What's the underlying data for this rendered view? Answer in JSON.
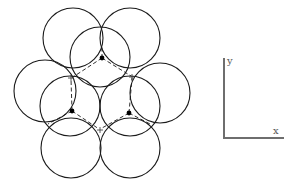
{
  "diagram": {
    "colors": {
      "stroke": "#1a1a1a",
      "axis": "#6e6e6e",
      "label": "#555555"
    },
    "back_layer_circles": [
      {
        "cx": 73,
        "cy": 38,
        "r": 30
      },
      {
        "cx": 130,
        "cy": 38,
        "r": 30
      },
      {
        "cx": 45,
        "cy": 91,
        "r": 31
      },
      {
        "cx": 160,
        "cy": 93,
        "r": 30
      },
      {
        "cx": 71,
        "cy": 148,
        "r": 30
      },
      {
        "cx": 130,
        "cy": 148,
        "r": 30
      }
    ],
    "front_layer_circles": [
      {
        "cx": 100,
        "cy": 57,
        "r": 30
      },
      {
        "cx": 70,
        "cy": 106,
        "r": 30
      },
      {
        "cx": 130,
        "cy": 106,
        "r": 30
      }
    ],
    "atom_dots": [
      {
        "x": 102,
        "y": 58
      },
      {
        "x": 72,
        "y": 111
      },
      {
        "x": 129,
        "y": 113
      }
    ],
    "plus_markers": [
      {
        "x": 71,
        "y": 78,
        "symbol": "+"
      },
      {
        "x": 132,
        "y": 77,
        "symbol": "+"
      },
      {
        "x": 100,
        "y": 130,
        "symbol": "+"
      }
    ],
    "axes": {
      "origin": {
        "x": 224,
        "y": 138
      },
      "y_end": {
        "x": 224,
        "y": 58
      },
      "x_end": {
        "x": 284,
        "y": 138
      },
      "y_label": "y",
      "x_label": "x"
    }
  }
}
